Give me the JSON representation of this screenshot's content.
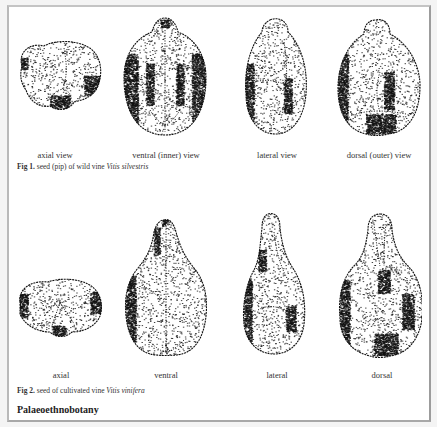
{
  "figures": [
    {
      "number_label": "Fig 1.",
      "caption_text": "seed (pip) of wild vine",
      "species": "Vitis silvestris",
      "views": [
        {
          "label": "axial view",
          "shape": "axial-wide"
        },
        {
          "label": "ventral (inner) view",
          "shape": "ventral-round"
        },
        {
          "label": "lateral view",
          "shape": "lateral-round"
        },
        {
          "label": "dorsal (outer) view",
          "shape": "dorsal-round"
        }
      ]
    },
    {
      "number_label": "Fig 2.",
      "caption_text": "seed of cultivated vine",
      "species": "Vitis vinifera",
      "views": [
        {
          "label": "axial",
          "shape": "axial-flat"
        },
        {
          "label": "ventral",
          "shape": "ventral-beaked"
        },
        {
          "label": "lateral",
          "shape": "lateral-beaked"
        },
        {
          "label": "dorsal",
          "shape": "dorsal-beaked"
        }
      ]
    }
  ],
  "section_title": "Palaeoethnobotany",
  "ink_color": "#111111"
}
